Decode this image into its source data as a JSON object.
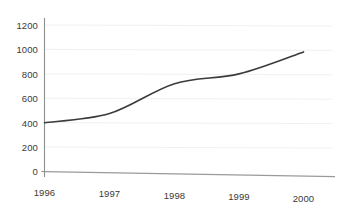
{
  "chart_data": {
    "type": "line",
    "title": "",
    "subtitle": "",
    "xlabel": "",
    "ylabel": "",
    "x": [
      "1996",
      "1997",
      "1998",
      "1999",
      "2000"
    ],
    "categories": [
      "1996",
      "1997",
      "1998",
      "1999",
      "2000"
    ],
    "values": [
      400,
      475,
      720,
      800,
      980
    ],
    "series": [
      {
        "name": "series-1",
        "values": [
          400,
          475,
          720,
          800,
          980
        ],
        "color": "#3b3b3b",
        "line_width": 1.6,
        "smooth": true,
        "markers": false
      }
    ],
    "ylim": [
      0,
      1250
    ],
    "yticks": [
      0,
      200,
      400,
      600,
      800,
      1000,
      1200
    ],
    "ytick_labels": [
      "0",
      "200",
      "400",
      "600",
      "800",
      "1000",
      "1200"
    ],
    "xtick_labels": [
      "1996",
      "1997",
      "1998",
      "1999",
      "2000"
    ],
    "grid": {
      "horizontal": true,
      "vertical": false,
      "color": "#f0f0f2"
    },
    "axis": {
      "y_axis_visible": true,
      "x_axis_visible": true,
      "axis_color": "#8a8a8a",
      "tick_color": "#8a8a8a"
    },
    "legend": {
      "visible": false,
      "position": "none",
      "entries": []
    },
    "background": "#ffffff",
    "annotations": []
  },
  "geometry": {
    "plot_left": 44,
    "plot_right": 330,
    "y_zero_px": 171.5,
    "px_per_200": 24.4,
    "x_positions": [
      44.5,
      109.5,
      174.5,
      239.0,
      303.5
    ],
    "y_label_x_right": 38,
    "x_label_y": [
      186.5,
      188.0,
      189.5,
      191.0,
      192.5
    ]
  }
}
